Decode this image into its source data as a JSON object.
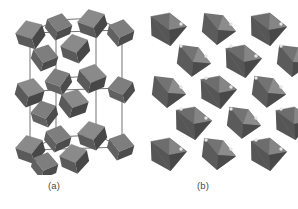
{
  "figure": {
    "background_color": "#ffffff",
    "panels": [
      {
        "id": "a",
        "label": "(a)",
        "description": "Perspective view of a unit cell built from tilted corner-sharing octahedra, outlined by thin unit-cell edge lines",
        "view": "perspective-unit-cell",
        "octahedron_count": 18,
        "cell_edges_visible": true
      },
      {
        "id": "b",
        "label": "(b)",
        "description": "Projection down an axis showing a checkerboard network of corner-sharing octahedra with bridging atoms at shared vertices",
        "view": "axial-projection",
        "octahedron_count": 17,
        "bridging_atoms_visible": true
      }
    ]
  },
  "colors": {
    "background": "#ffffff",
    "octahedron_light": "#8a8a8a",
    "octahedron_mid": "#6e6e6e",
    "octahedron_dark": "#565656",
    "octahedron_darkest": "#454545",
    "edge_line": "#5a5a5a",
    "bridging_atom": "#e8e8e8",
    "caption_text": "#4a4a4a"
  },
  "captions": {
    "panel_a": "(a)",
    "panel_b": "(b)"
  }
}
